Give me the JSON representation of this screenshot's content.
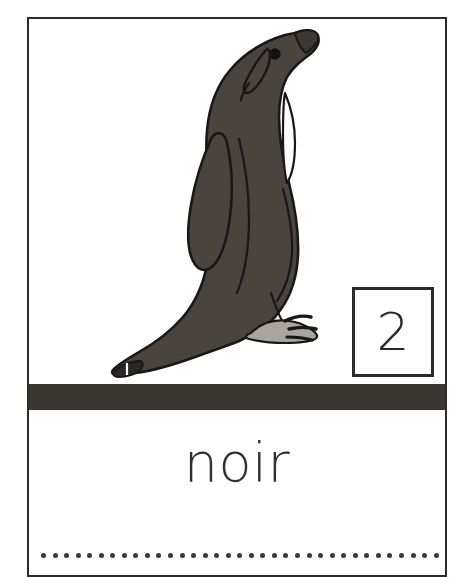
{
  "card": {
    "type": "vocabulary-flashcard",
    "language": "French",
    "word": "noir",
    "number": "2",
    "border_color": "#2e2c2b",
    "background_color": "#ffffff"
  },
  "illustration": {
    "subject": "penguin",
    "body_color": "#4a443f",
    "outline_color": "#1a1817",
    "foot_color": "#a9a49f",
    "highlight_color": "#ffffff"
  },
  "number_box": {
    "value": "2",
    "border_color": "#2e2c2b"
  },
  "separator": {
    "color": "#3a3632"
  },
  "word_area": {
    "text": "noir",
    "color": "#333130"
  },
  "writing_guide": {
    "dot_color": "#3a3836",
    "dot_count": 35
  }
}
